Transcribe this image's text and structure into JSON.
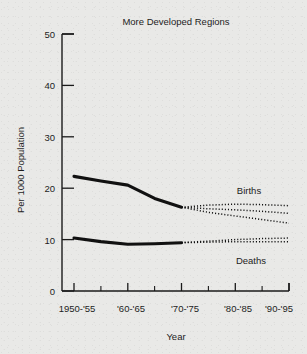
{
  "chart_data": {
    "type": "line",
    "title": "More Developed Regions",
    "xlabel": "Year",
    "ylabel": "Per 1000 Population",
    "ylim": [
      0,
      50
    ],
    "yticks": [
      0,
      10,
      20,
      30,
      40,
      50
    ],
    "ytick_labels": [
      "0",
      "10",
      "20",
      "30",
      "40",
      "50"
    ],
    "grid": false,
    "legend_position": "inline-right",
    "x_periods": [
      "1950-'55",
      "'55-'60",
      "'60-'65",
      "'65-'70",
      "'70-'75",
      "'75-'80",
      "'80-'85",
      "'85-'90",
      "'90-'95"
    ],
    "xtick_labels": [
      "1950-'55",
      "'60-'65",
      "'70-'75",
      "'80-'85",
      "'90-'95"
    ],
    "series": [
      {
        "name": "Births",
        "style": "solid",
        "segment": "observed",
        "x": [
          "1950-'55",
          "'55-'60",
          "'60-'65",
          "'65-'70",
          "'70-'75"
        ],
        "values": [
          22.3,
          21.4,
          20.6,
          18.0,
          16.3
        ]
      },
      {
        "name": "Births projection high",
        "style": "dotted",
        "segment": "projected",
        "x": [
          "'70-'75",
          "'75-'80",
          "'80-'85",
          "'85-'90",
          "'90-'95"
        ],
        "values": [
          16.3,
          16.7,
          16.9,
          16.8,
          16.6
        ]
      },
      {
        "name": "Births projection medium",
        "style": "dotted",
        "segment": "projected",
        "x": [
          "'70-'75",
          "'75-'80",
          "'80-'85",
          "'85-'90",
          "'90-'95"
        ],
        "values": [
          16.3,
          16.0,
          15.8,
          15.5,
          15.1
        ]
      },
      {
        "name": "Births projection low",
        "style": "dotted",
        "segment": "projected",
        "x": [
          "'70-'75",
          "'75-'80",
          "'80-'85",
          "'85-'90",
          "'90-'95"
        ],
        "values": [
          16.3,
          15.3,
          14.6,
          13.9,
          13.2
        ]
      },
      {
        "name": "Deaths",
        "style": "solid",
        "segment": "observed",
        "x": [
          "1950-'55",
          "'55-'60",
          "'60-'65",
          "'65-'70",
          "'70-'75"
        ],
        "values": [
          10.3,
          9.6,
          9.1,
          9.2,
          9.4
        ]
      },
      {
        "name": "Deaths projection high",
        "style": "dotted",
        "segment": "projected",
        "x": [
          "'70-'75",
          "'75-'80",
          "'80-'85",
          "'85-'90",
          "'90-'95"
        ],
        "values": [
          9.4,
          9.7,
          10.0,
          10.2,
          10.3
        ]
      },
      {
        "name": "Deaths projection low",
        "style": "dotted",
        "segment": "projected",
        "x": [
          "'70-'75",
          "'75-'80",
          "'80-'85",
          "'85-'90",
          "'90-'95"
        ],
        "values": [
          9.4,
          9.5,
          9.6,
          9.6,
          9.6
        ]
      }
    ],
    "annotations": [
      {
        "text": "Births",
        "series": "Births"
      },
      {
        "text": "Deaths",
        "series": "Deaths"
      }
    ]
  },
  "labels": {
    "title": "More Developed Regions",
    "ylabel": "Per 1000 Population",
    "xlabel": "Year",
    "births": "Births",
    "deaths": "Deaths",
    "y0": "0",
    "y10": "10",
    "y20": "20",
    "y30": "30",
    "y40": "40",
    "y50": "50",
    "x1": "1950-'55",
    "x2": "'60-'65",
    "x3": "'70-'75",
    "x4": "'80-'85",
    "x5": "'90-'95"
  },
  "colors": {
    "background": "#e9e9e7",
    "ink": "#1a1a1a"
  }
}
